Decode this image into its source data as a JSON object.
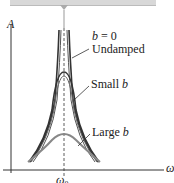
{
  "figure": {
    "y_axis_label": "A",
    "x_axis_label": "ω",
    "x_tick_label": "ω0",
    "x_tick_main": "ω",
    "x_tick_sub": "0",
    "curves": [
      {
        "name": "undamped",
        "label_line1_var": "b",
        "label_line1_rest": " = 0",
        "label_line2": "Undamped",
        "color": "#333333"
      },
      {
        "name": "small-b",
        "label_text": "Small ",
        "label_var": "b",
        "color": "#333333"
      },
      {
        "name": "large-b",
        "label_text": "Large ",
        "label_var": "b",
        "color": "#888888"
      }
    ],
    "resonance_line_style": "dashed"
  }
}
